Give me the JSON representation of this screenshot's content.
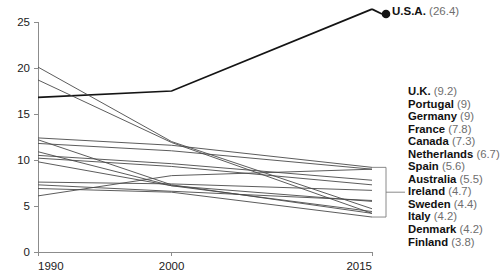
{
  "chart_data": {
    "type": "line",
    "title": "",
    "xlabel": "",
    "ylabel": "",
    "x": [
      1990,
      2000,
      2015
    ],
    "xtick_labels": [
      "1990",
      "2000",
      "2015"
    ],
    "ytick_labels": [
      "0",
      "5",
      "10",
      "15",
      "20",
      "25"
    ],
    "ytick_values": [
      0,
      5,
      10,
      15,
      20,
      25
    ],
    "ylim": [
      0,
      25
    ],
    "xlim": [
      1990,
      2015
    ],
    "grid": false,
    "legend_position": "right",
    "highlight_color": "#141414",
    "line_color": "#4a4a4a",
    "axis_color": "#8c8c8c",
    "series": [
      {
        "name": "U.S.A.",
        "label": "U.S.A.",
        "value": 26.4,
        "value_text": "(26.4)",
        "highlight": true,
        "marker": "dot",
        "values": [
          16.8,
          17.5,
          26.4
        ]
      },
      {
        "name": "U.K.",
        "label": "U.K.",
        "value": 9.2,
        "value_text": "(9.2)",
        "highlight": false,
        "values": [
          12.4,
          11.6,
          9.2
        ]
      },
      {
        "name": "Portugal",
        "label": "Portugal",
        "value": 9,
        "value_text": "(9)",
        "highlight": false,
        "values": [
          6.1,
          8.3,
          9.0
        ]
      },
      {
        "name": "Germany",
        "label": "Germany",
        "value": 9,
        "value_text": "(9)",
        "highlight": false,
        "values": [
          11.8,
          11.0,
          9.0
        ]
      },
      {
        "name": "France",
        "label": "France",
        "value": 7.8,
        "value_text": "(7.8)",
        "highlight": false,
        "values": [
          10.5,
          9.6,
          7.8
        ]
      },
      {
        "name": "Canada",
        "label": "Canada",
        "value": 7.3,
        "value_text": "(7.3)",
        "highlight": false,
        "values": [
          10.2,
          9.3,
          7.3
        ]
      },
      {
        "name": "Netherlands",
        "label": "Netherlands",
        "value": 6.7,
        "value_text": "(6.7)",
        "highlight": false,
        "values": [
          7.6,
          7.4,
          6.7
        ]
      },
      {
        "name": "Spain",
        "label": "Spain",
        "value": 5.6,
        "value_text": "(5.6)",
        "highlight": false,
        "values": [
          7.3,
          6.6,
          5.6
        ]
      },
      {
        "name": "Australia",
        "label": "Australia",
        "value": 5.5,
        "value_text": "(5.5)",
        "highlight": false,
        "values": [
          9.8,
          7.2,
          5.5
        ]
      },
      {
        "name": "Ireland",
        "label": "Ireland",
        "value": 4.7,
        "value_text": "(4.7)",
        "highlight": false,
        "values": [
          20.1,
          12.0,
          4.7
        ]
      },
      {
        "name": "Sweden",
        "label": "Sweden",
        "value": 4.4,
        "value_text": "(4.4)",
        "highlight": false,
        "values": [
          10.9,
          7.2,
          4.4
        ]
      },
      {
        "name": "Italy",
        "label": "Italy",
        "value": 4.2,
        "value_text": "(4.2)",
        "highlight": false,
        "values": [
          18.7,
          11.9,
          4.2
        ]
      },
      {
        "name": "Denmark",
        "label": "Denmark",
        "value": 4.2,
        "value_text": "(4.2)",
        "highlight": false,
        "values": [
          12.2,
          7.3,
          4.2
        ]
      },
      {
        "name": "Finland",
        "label": "Finland",
        "value": 3.8,
        "value_text": "(3.8)",
        "highlight": false,
        "values": [
          6.9,
          6.5,
          3.8
        ]
      }
    ]
  },
  "usa_callout": {
    "label": "U.S.A.",
    "value_text": "(26.4)"
  }
}
